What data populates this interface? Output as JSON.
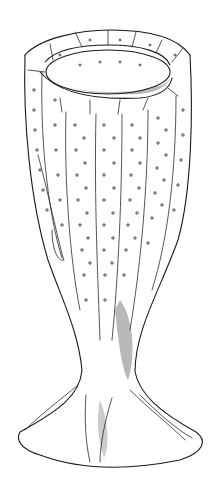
{
  "figure": {
    "style": "pen-and-ink line drawing with stippling",
    "colors": {
      "background": "#ffffff",
      "ink": "#1a1a1a"
    },
    "parts": [
      "rim",
      "osculum",
      "body",
      "stalk",
      "base"
    ]
  }
}
